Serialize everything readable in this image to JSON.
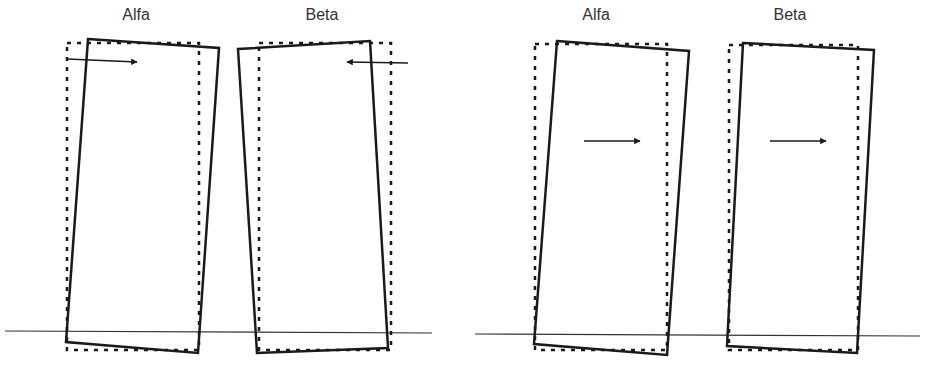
{
  "colors": {
    "stroke": "#1a1a1a",
    "ground": "#333333",
    "text": "#333333",
    "background": "#ffffff"
  },
  "panels": [
    {
      "name": "left-panel",
      "ground": {
        "x1": 5,
        "y1": 331,
        "x2": 432,
        "y2": 333
      },
      "blocks": [
        {
          "label": "Alfa",
          "label_pos": [
            136,
            24
          ],
          "solid": "88,39 219,48 198,353 66,342",
          "dashed": "67,43 199,43 199,350 67,350",
          "arrow": {
            "x1": 67,
            "y1": 59,
            "x2": 137,
            "y2": 62,
            "direction": "right"
          }
        },
        {
          "label": "Beta",
          "label_pos": [
            322,
            24
          ],
          "solid": "238,49 370,41 388,348 257,353",
          "dashed": "259,43 391,43 391,350 259,350",
          "arrow": {
            "x1": 408,
            "y1": 63,
            "x2": 347,
            "y2": 62,
            "direction": "left"
          }
        }
      ]
    },
    {
      "name": "right-panel",
      "ground": {
        "x1": 475,
        "y1": 334,
        "x2": 920,
        "y2": 336
      },
      "blocks": [
        {
          "label": "Alfa",
          "label_pos": [
            596,
            24
          ],
          "solid": "557,41 689,51 667,355 534,344",
          "dashed": "535,44 667,44 667,350 535,350",
          "arrow": {
            "x1": 584,
            "y1": 141,
            "x2": 640,
            "y2": 141,
            "direction": "right"
          }
        },
        {
          "label": "Beta",
          "label_pos": [
            790,
            24
          ],
          "solid": "743,43 874,50 857,353 727,346",
          "dashed": "729,45 858,45 858,350 729,350",
          "arrow": {
            "x1": 770,
            "y1": 141,
            "x2": 826,
            "y2": 141,
            "direction": "right"
          }
        }
      ]
    }
  ]
}
